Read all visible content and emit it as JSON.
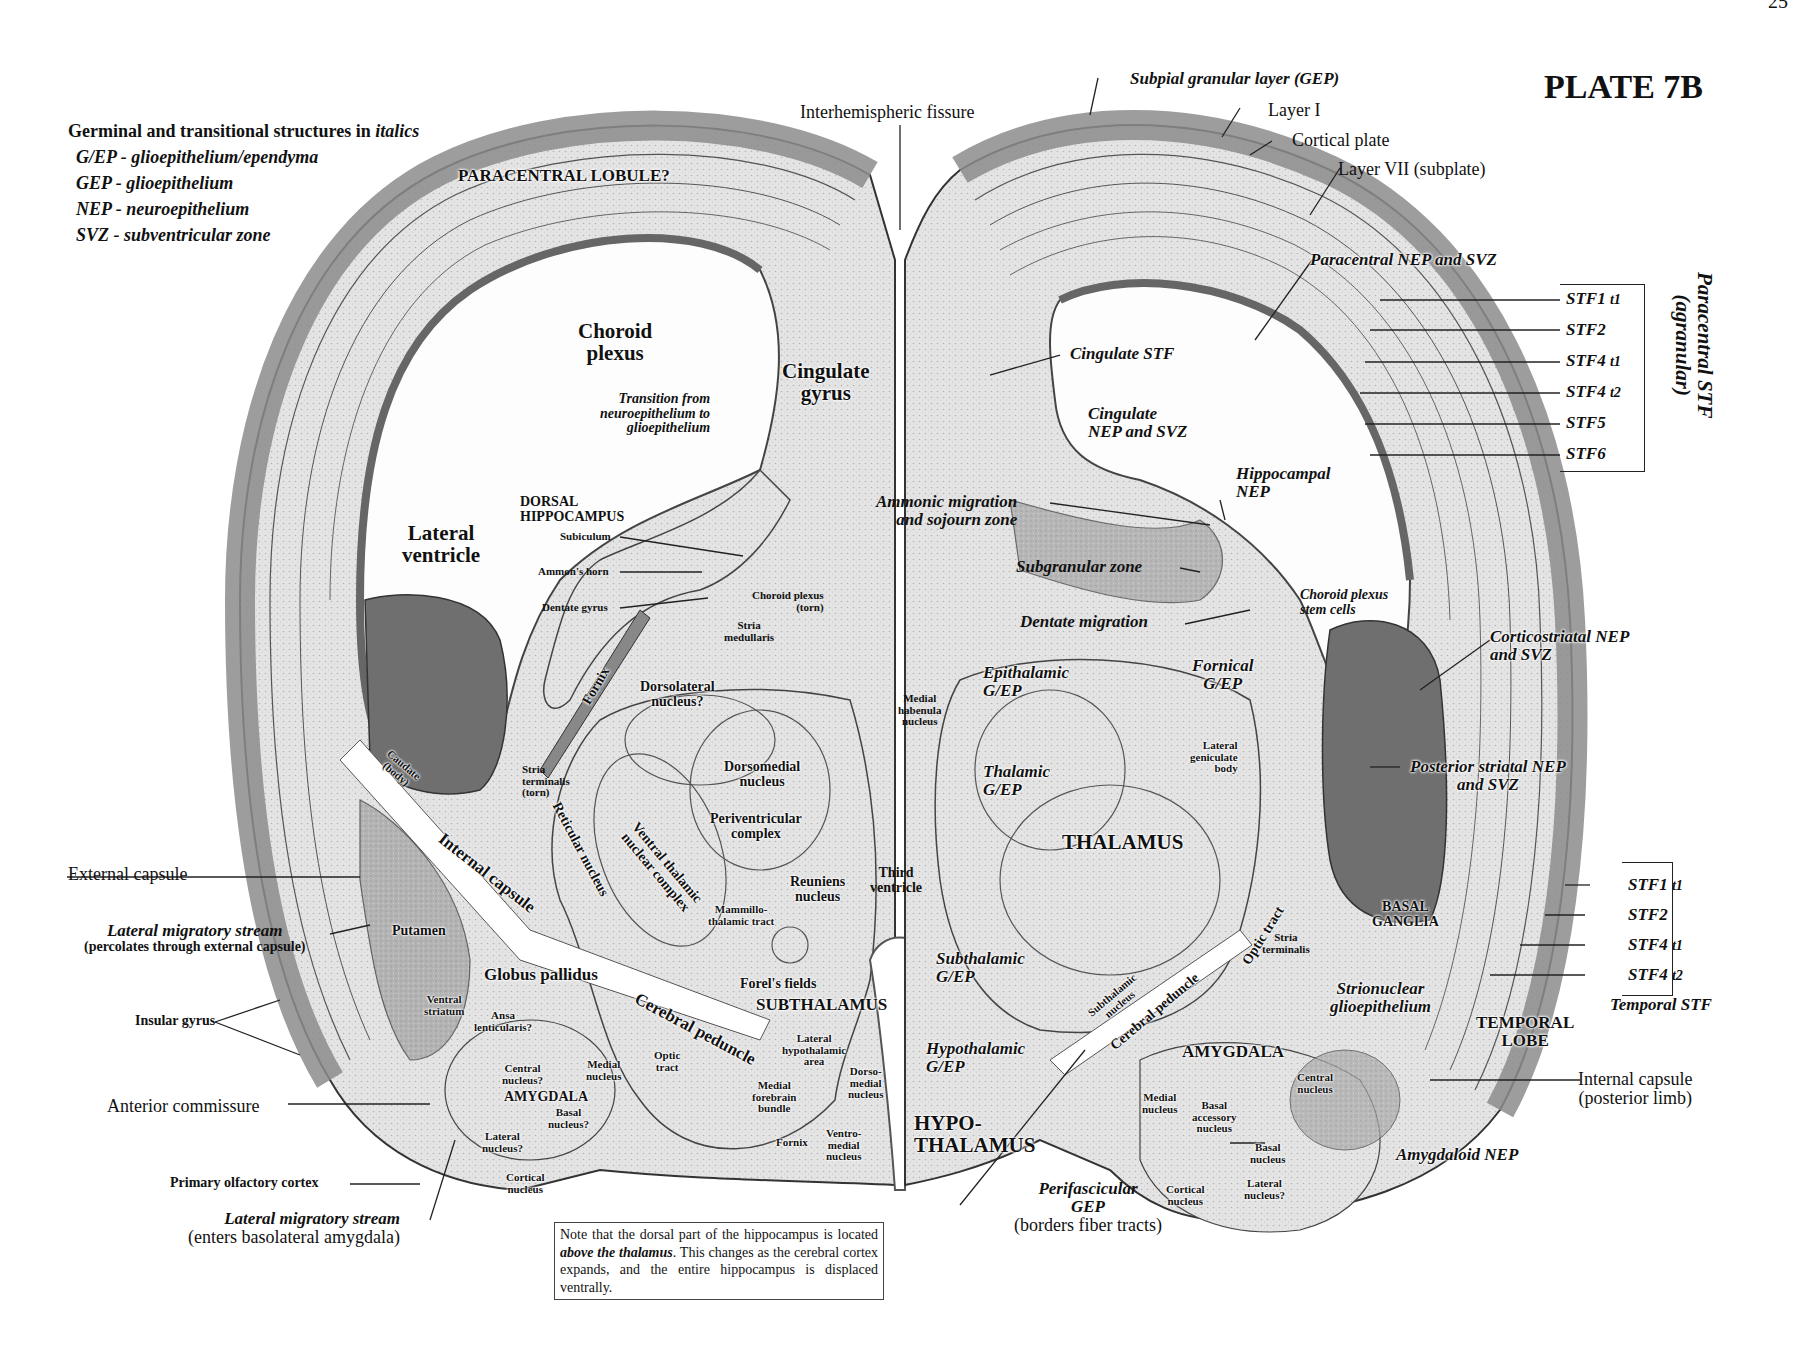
{
  "page": {
    "number": "25",
    "plate": "PLATE 7B"
  },
  "legend": {
    "heading_prefix": "Germinal and transitional structures in ",
    "heading_italic": "italics",
    "items": [
      "G/EP - glioepithelium/ependyma",
      "GEP - glioepithelium",
      "NEP - neuroepithelium",
      "SVZ - subventricular zone"
    ]
  },
  "note": {
    "part1": "Note that the dorsal part of the hippocampus is located ",
    "emphasis": "above the thalamus",
    "part2": ". This changes as the cerebral cortex expands, and the entire hippocampus is displaced ventrally."
  },
  "labels": {
    "interhemispheric": "Interhemispheric fissure",
    "paracentral_lobule": "PARACENTRAL LOBULE?",
    "choroid_plexus": [
      "Choroid",
      "plexus"
    ],
    "cingulate_gyrus": [
      "Cingulate",
      "gyrus"
    ],
    "transition": [
      "Transition from",
      "neuroepithelium to",
      "glioepithelium"
    ],
    "dorsal_hippocampus": [
      "DORSAL",
      "HIPPOCAMPUS"
    ],
    "subiculum": "Subiculum",
    "ammons_horn": "Ammon's horn",
    "dentate_gyrus": "Dentate gyrus",
    "lateral_ventricle": [
      "Lateral",
      "ventricle"
    ],
    "choroid_torn": [
      "Choroid plexus",
      "(torn)"
    ],
    "stria_medullaris": [
      "Stria",
      "medullaris"
    ],
    "fornix": "Fornix",
    "dorsolateral": [
      "Dorsolateral",
      "nucleus?"
    ],
    "dorsomedial": [
      "Dorsomedial",
      "nucleus"
    ],
    "periventricular": [
      "Periventricular",
      "complex"
    ],
    "ventral_thalamic": [
      "Ventral thalamic",
      "nuclear complex"
    ],
    "reticular": "Reticular nucleus",
    "caudate": [
      "Caudate",
      "(body)"
    ],
    "stria_terminalis_torn": [
      "Stria",
      "terminalis",
      "(torn)"
    ],
    "internal_capsule": "Internal capsule",
    "mammillothalamic": [
      "Mammillo-",
      "thalamic tract"
    ],
    "reuniens": [
      "Reuniens",
      "nucleus"
    ],
    "third_ventricle": [
      "Third",
      "ventricle"
    ],
    "external_capsule": "External capsule",
    "lms_top": "Lateral migratory stream",
    "lms_top_sub": "(percolates through external capsule)",
    "putamen": "Putamen",
    "globus_pallidus": "Globus pallidus",
    "ventral_striatum": [
      "Ventral",
      "striatum"
    ],
    "insular_gyrus": "Insular gyrus",
    "ansa": [
      "Ansa",
      "lenticularis?"
    ],
    "forels_fields": "Forel's fields",
    "subthalamus": "SUBTHALAMUS",
    "cerebral_peduncle_left": "Cerebral peduncle",
    "lateral_hypothalamic": [
      "Lateral",
      "hypothalamic",
      "area"
    ],
    "anterior_commissure": "Anterior commissure",
    "central_nucleus_q": [
      "Central",
      "nucleus?"
    ],
    "medial_nucleus_left": [
      "Medial",
      "nucleus"
    ],
    "optic_tract_left": [
      "Optic",
      "tract"
    ],
    "amygdala_left": "AMYGDALA",
    "basal_nucleus_q": [
      "Basal",
      "nucleus?"
    ],
    "lateral_nucleus_q_left": [
      "Lateral",
      "nucleus?"
    ],
    "medial_forebrain": [
      "Medial",
      "forebrain",
      "bundle"
    ],
    "dorsomedial_hypo": [
      "Dorso-",
      "medial",
      "nucleus"
    ],
    "fornix_small": "Fornix",
    "ventromedial": [
      "Ventro-",
      "medial",
      "nucleus"
    ],
    "hypothalamus": [
      "HYPO-",
      "THALAMUS"
    ],
    "primary_olfactory": "Primary olfactory cortex",
    "cortical_nucleus_left": [
      "Cortical",
      "nucleus"
    ],
    "lms_bottom": "Lateral migratory stream",
    "lms_bottom_sub": "(enters basolateral amygdala)",
    "subpial": "Subpial granular layer (GEP)",
    "layer1": "Layer I",
    "cortical_plate": "Cortical plate",
    "layer7": "Layer VII (subplate)",
    "paracentral_nep": "Paracentral NEP and SVZ",
    "cingulate_stf": "Cingulate STF",
    "cingulate_nep": [
      "Cingulate",
      "NEP and SVZ"
    ],
    "hippocampal_nep": [
      "Hippocampal",
      "NEP"
    ],
    "ammonic_migration": [
      "Ammonic migration",
      "and sojourn zone"
    ],
    "subgranular": "Subgranular zone",
    "choroid_stem": [
      "Choroid plexus",
      "stem cells"
    ],
    "dentate_migration": "Dentate migration",
    "corticostriatal": [
      "Corticostriatal NEP",
      "and SVZ"
    ],
    "epithalamic": [
      "Epithalamic",
      "G/EP"
    ],
    "medial_habenula": [
      "Medial",
      "habenula",
      "nucleus"
    ],
    "fornical": [
      "Fornical",
      "G/EP"
    ],
    "lateral_geniculate": [
      "Lateral",
      "geniculate",
      "body"
    ],
    "thalamic_gep": [
      "Thalamic",
      "G/EP"
    ],
    "posterior_striatal": [
      "Posterior striatal NEP",
      "and SVZ"
    ],
    "thalamus": "THALAMUS",
    "basal_ganglia": [
      "BASAL",
      "GANGLIA"
    ],
    "stria_terminalis": [
      "Stria",
      "terminalis"
    ],
    "optic_tract_right": "Optic tract",
    "subthalamic_gep": [
      "Subthalamic",
      "G/EP"
    ],
    "subthalamic_nucleus": [
      "Subthalamic",
      "nucleus"
    ],
    "cerebral_peduncle_right": "Cerebral peduncle",
    "strionuclear": [
      "Strionuclear",
      "glioepithelium"
    ],
    "hypothalamic_gep": [
      "Hypothalamic",
      "G/EP"
    ],
    "amygdala_right": "AMYGDALA",
    "temporal_lobe": [
      "TEMPORAL",
      "LOBE"
    ],
    "internal_capsule_post": [
      "Internal capsule",
      "(posterior limb)"
    ],
    "central_nucleus_r": [
      "Central",
      "nucleus"
    ],
    "medial_nucleus_r": [
      "Medial",
      "nucleus"
    ],
    "basal_accessory": [
      "Basal",
      "accessory",
      "nucleus"
    ],
    "basal_nucleus_r": [
      "Basal",
      "nucleus"
    ],
    "amygdaloid_nep": "Amygdaloid NEP",
    "perifascicular": [
      "Perifascicular",
      "GEP"
    ],
    "perifascicular_sub": "(borders fiber tracts)",
    "cortical_nucleus_r": [
      "Cortical",
      "nucleus"
    ],
    "lateral_nucleus_q_r": [
      "Lateral",
      "nucleus?"
    ]
  },
  "paracentral_stf": {
    "title": "Paracentral STF",
    "subtitle": "(agranular)",
    "layers": [
      {
        "name": "STF1",
        "sub": "t1"
      },
      {
        "name": "STF2",
        "sub": ""
      },
      {
        "name": "STF4",
        "sub": "t1"
      },
      {
        "name": "STF4",
        "sub": "t2"
      },
      {
        "name": "STF5",
        "sub": ""
      },
      {
        "name": "STF6",
        "sub": ""
      }
    ]
  },
  "temporal_stf": {
    "title": "Temporal STF",
    "layers": [
      {
        "name": "STF1",
        "sub": "t1"
      },
      {
        "name": "STF2",
        "sub": ""
      },
      {
        "name": "STF4",
        "sub": "t1"
      },
      {
        "name": "STF4",
        "sub": "t2"
      }
    ]
  },
  "colors": {
    "tissue_light": "#e6e6e6",
    "tissue_mid": "#bdbdbd",
    "tissue_dark": "#777777",
    "outline": "#333333",
    "paper": "#ffffff"
  }
}
